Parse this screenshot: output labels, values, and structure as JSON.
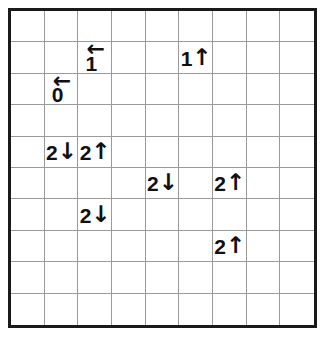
{
  "puzzle": {
    "title": "Arrow number grid puzzle",
    "grid": {
      "columns": 9,
      "rows": 10,
      "cell_width": 34.3,
      "cell_height": 32.0,
      "border_color": "#1a1a1a",
      "line_color": "#9a9a9a",
      "background_color": "#ffffff"
    },
    "clues": [
      {
        "id": "clue-c3-r2",
        "number": "1",
        "arrow": "←",
        "direction": "left",
        "layout": "stacked",
        "col": 3,
        "row": 2
      },
      {
        "id": "clue-c2-r3",
        "number": "0",
        "arrow": "←",
        "direction": "left",
        "layout": "stacked",
        "col": 2,
        "row": 3
      },
      {
        "id": "clue-c6-r2",
        "number": "1",
        "arrow": "↑",
        "direction": "up",
        "layout": "inline",
        "col": 6,
        "row": 2
      },
      {
        "id": "clue-c2-r5",
        "number": "2",
        "arrow": "↓",
        "direction": "down",
        "layout": "inline",
        "col": 2,
        "row": 5
      },
      {
        "id": "clue-c3-r5",
        "number": "2",
        "arrow": "↑",
        "direction": "up",
        "layout": "inline",
        "col": 3,
        "row": 5
      },
      {
        "id": "clue-c5-r6",
        "number": "2",
        "arrow": "↓",
        "direction": "down",
        "layout": "inline",
        "col": 5,
        "row": 6
      },
      {
        "id": "clue-c7-r6",
        "number": "2",
        "arrow": "↑",
        "direction": "up",
        "layout": "inline",
        "col": 7,
        "row": 6
      },
      {
        "id": "clue-c3-r7",
        "number": "2",
        "arrow": "↓",
        "direction": "down",
        "layout": "inline",
        "col": 3,
        "row": 7
      },
      {
        "id": "clue-c7-r8",
        "number": "2",
        "arrow": "↑",
        "direction": "up",
        "layout": "inline",
        "col": 7,
        "row": 8
      }
    ]
  }
}
